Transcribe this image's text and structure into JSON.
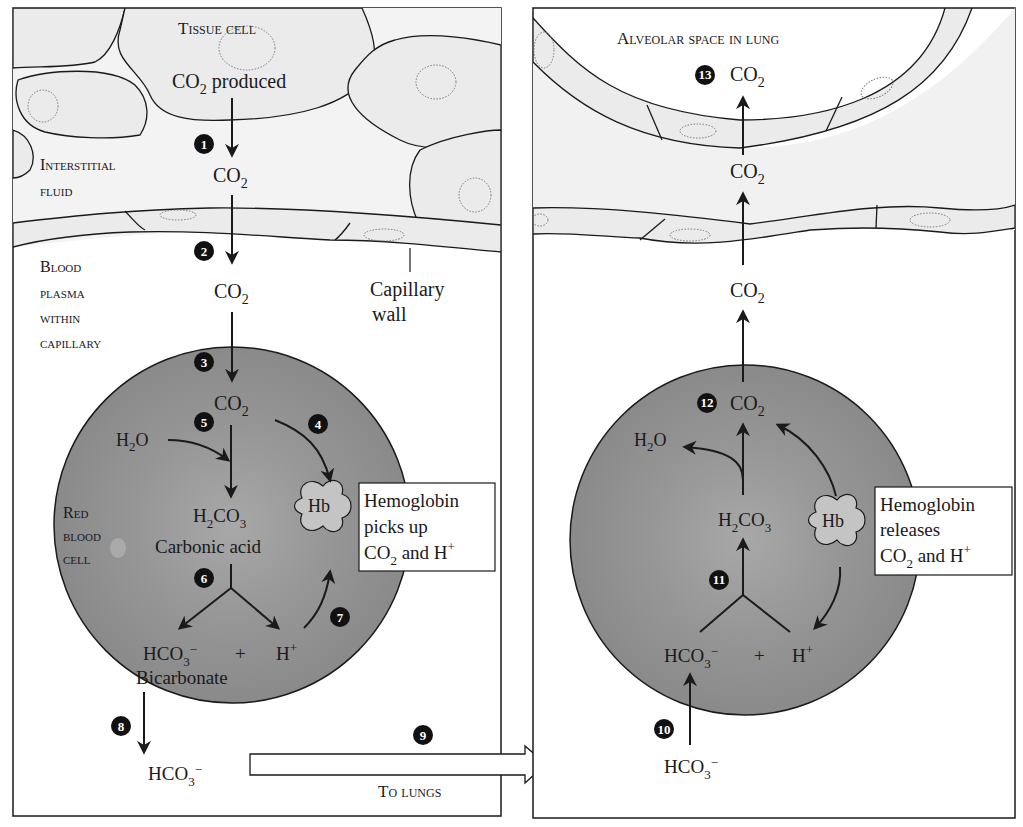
{
  "left_panel": {
    "region_labels": {
      "tissue_cell": "Tissue cell",
      "interstitial_line1": "Interstitial",
      "interstitial_line2": "fluid",
      "plasma_line1": "Blood",
      "plasma_line2": "plasma",
      "plasma_line3": "within",
      "plasma_line4": "capillary",
      "rbc_line1": "Red",
      "rbc_line2": "blood",
      "rbc_line3": "cell",
      "capillary_wall_line1": "Capillary",
      "capillary_wall_line2": "wall"
    },
    "species": {
      "co2_produced": "produced",
      "carbonic_acid": "Carbonic acid",
      "bicarbonate": "Bicarbonate",
      "hb": "Hb",
      "plus": "+"
    },
    "hb_box": {
      "line1": "Hemoglobin",
      "line2": "picks up",
      "line3_tail": " and H"
    },
    "to_lungs": "To lungs"
  },
  "right_panel": {
    "region_labels": {
      "alveolar_space": "Alveolar space in lung"
    },
    "species": {
      "hb": "Hb",
      "plus": "+"
    },
    "hb_box": {
      "line1": "Hemoglobin",
      "line2": "releases",
      "line3_tail": " and H"
    }
  },
  "steps": [
    "1",
    "2",
    "3",
    "4",
    "5",
    "6",
    "7",
    "8",
    "9",
    "10",
    "11",
    "12",
    "13"
  ],
  "colors": {
    "tissue_fill": "#ebebeb",
    "rbc_fill": "#8f8f8f",
    "rbc_center": "#a3a3a3",
    "outline": "#1a1a1a",
    "badge": "#111111",
    "background": "#ffffff"
  }
}
